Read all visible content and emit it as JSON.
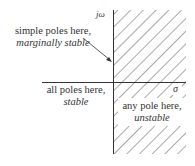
{
  "diagram": {
    "type": "s-plane stability regions",
    "axes": {
      "vertical_label": "jω",
      "horizontal_label": "σ"
    },
    "regions": [
      {
        "id": "imaginary-axis",
        "line1": "simple poles here,",
        "line2": "marginally stable"
      },
      {
        "id": "left-half-plane",
        "line1": "all poles here,",
        "line2": "stable"
      },
      {
        "id": "right-half-plane",
        "line1": "any pole here,",
        "line2": "unstable"
      }
    ],
    "colors": {
      "line": "#333333",
      "hatch": "#555555",
      "background": "#ffffff"
    }
  }
}
